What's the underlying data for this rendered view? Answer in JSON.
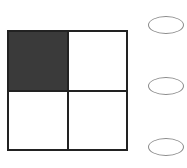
{
  "figure": {
    "type": "2x2 grid",
    "rows": 2,
    "cols": 2,
    "cells": [
      {
        "row": 0,
        "col": 0,
        "filled": true
      },
      {
        "row": 0,
        "col": 1,
        "filled": false
      },
      {
        "row": 1,
        "col": 0,
        "filled": false
      },
      {
        "row": 1,
        "col": 1,
        "filled": false
      }
    ],
    "fill_color": "#3a3a3a",
    "line_color": "#222222"
  },
  "options": [
    {
      "id": "option-1",
      "label": "",
      "selected": false
    },
    {
      "id": "option-2",
      "label": "",
      "selected": false
    },
    {
      "id": "option-3",
      "label": "",
      "selected": false
    }
  ],
  "colors": {
    "option_border": "#8a8a8a",
    "background": "#ffffff"
  }
}
